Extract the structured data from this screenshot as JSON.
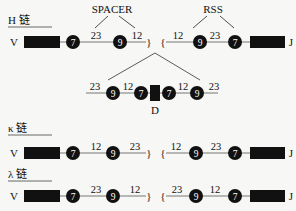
{
  "diagram": {
    "top_labels": {
      "spacer": "SPACER",
      "rss": "RSS"
    },
    "chains": [
      {
        "id": "heavy",
        "label": "H 链",
        "left_segment": "V",
        "right_segment": "J",
        "left_rss": {
          "heptamer": "7",
          "spacer1": "23",
          "nonamer": "9",
          "spacer2": "12"
        },
        "right_rss": {
          "spacer1": "12",
          "nonamer": "9",
          "spacer2": "23",
          "heptamer": "7"
        },
        "d_segment": {
          "label": "D",
          "left_rss": {
            "spacer_outer": "23",
            "nonamer": "9",
            "spacer_inner": "12",
            "heptamer": "7"
          },
          "right_rss": {
            "heptamer": "7",
            "spacer_inner": "12",
            "nonamer": "9",
            "spacer_outer": "23"
          }
        }
      },
      {
        "id": "kappa",
        "label": "κ 链",
        "left_segment": "V",
        "right_segment": "J",
        "left_rss": {
          "heptamer": "7",
          "spacer1": "12",
          "nonamer": "9",
          "spacer2": "23"
        },
        "right_rss": {
          "spacer1": "12",
          "nonamer": "9",
          "spacer2": "23",
          "heptamer": "7"
        }
      },
      {
        "id": "lambda",
        "label": "λ 链",
        "left_segment": "V",
        "right_segment": "J",
        "left_rss": {
          "heptamer": "7",
          "spacer1": "23",
          "nonamer": "9",
          "spacer2": "12"
        },
        "right_rss": {
          "spacer1": "23",
          "nonamer": "9",
          "spacer2": "12",
          "heptamer": "7"
        }
      }
    ],
    "colors": {
      "ink": "#111111",
      "background": "#f7f7f5",
      "line": "#555555"
    }
  }
}
